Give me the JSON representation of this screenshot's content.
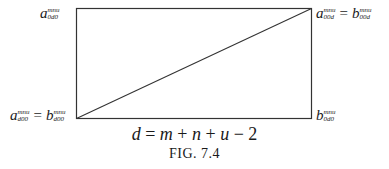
{
  "figure": {
    "caption": "FIG. 7.4",
    "formula": {
      "lhs": "d",
      "equals": "=",
      "terms": [
        "m",
        "+",
        "n",
        "+",
        "u",
        "−",
        "2"
      ],
      "full_text": "d = m + n + u − 2"
    },
    "rectangle": {
      "x": 76,
      "y": 8,
      "width": 235,
      "height": 110,
      "stroke": "#333333"
    },
    "diagonal": {
      "from": "bottom-left",
      "to": "top-right"
    },
    "corners": {
      "top_left": {
        "parts": [
          {
            "base": "a",
            "sup": "mnu",
            "sub": "0d0"
          }
        ],
        "text": "a^mnu_0d0"
      },
      "top_right": {
        "parts": [
          {
            "base": "a",
            "sup": "mnu",
            "sub": "00d"
          },
          {
            "base": "b",
            "sup": "mnu",
            "sub": "00d"
          }
        ],
        "equals": "=",
        "text": "a^mnu_00d = b^mnu_00d"
      },
      "bottom_left": {
        "parts": [
          {
            "base": "a",
            "sup": "mnu",
            "sub": "d00"
          },
          {
            "base": "b",
            "sup": "mnu",
            "sub": "d00"
          }
        ],
        "equals": "=",
        "text": "a^mnu_d00 = b^mnu_d00"
      },
      "bottom_right": {
        "parts": [
          {
            "base": "b",
            "sup": "mnu",
            "sub": "0d0"
          }
        ],
        "text": "b^mnu_0d0"
      }
    }
  }
}
